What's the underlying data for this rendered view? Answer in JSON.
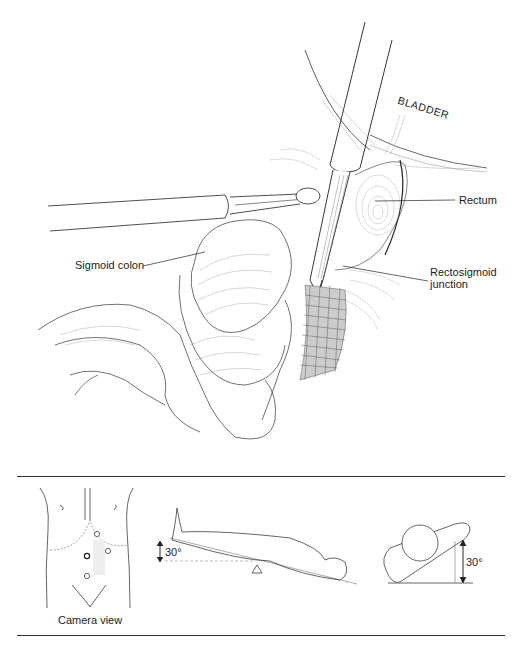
{
  "figure": {
    "main_illustration": {
      "description": "Laparoscopic view of pelvis with laparoscope and grasper retracting sigmoid colon",
      "labels": {
        "bladder": "BLADDER",
        "rectum": "Rectum",
        "sigmoid_colon": "Sigmoid colon",
        "rectosigmoid_line1": "Rectosigmoid",
        "rectosigmoid_line2": "junction"
      }
    },
    "inset_panel": {
      "camera_view_caption": "Camera view",
      "tilt_angle_left": "30°",
      "tilt_angle_right": "30°",
      "port_count": 4
    },
    "colors": {
      "line": "#222222",
      "background": "#ffffff",
      "hatch": "#555555"
    }
  }
}
